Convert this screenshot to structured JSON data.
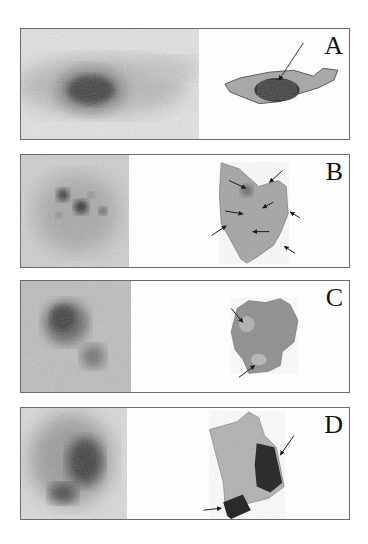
{
  "figure": {
    "panels": [
      {
        "label": "A",
        "scan": "scintigraphy-panel-a",
        "specimen": "tissue-specimen-a",
        "arrow_count": 1
      },
      {
        "label": "B",
        "scan": "scintigraphy-panel-b",
        "specimen": "tissue-specimen-b",
        "arrow_count": 7
      },
      {
        "label": "C",
        "scan": "scintigraphy-panel-c",
        "specimen": "tissue-specimen-c",
        "arrow_count": 2
      },
      {
        "label": "D",
        "scan": "scintigraphy-panel-d",
        "specimen": "tissue-specimen-d",
        "arrow_count": 2
      }
    ],
    "colors": {
      "border": "#6b6b6b",
      "scan_background": "#cfcfcf",
      "hotspot": "#2e2e2e",
      "specimen": "#9a9a9a",
      "arrow": "#1a1a1a"
    }
  }
}
